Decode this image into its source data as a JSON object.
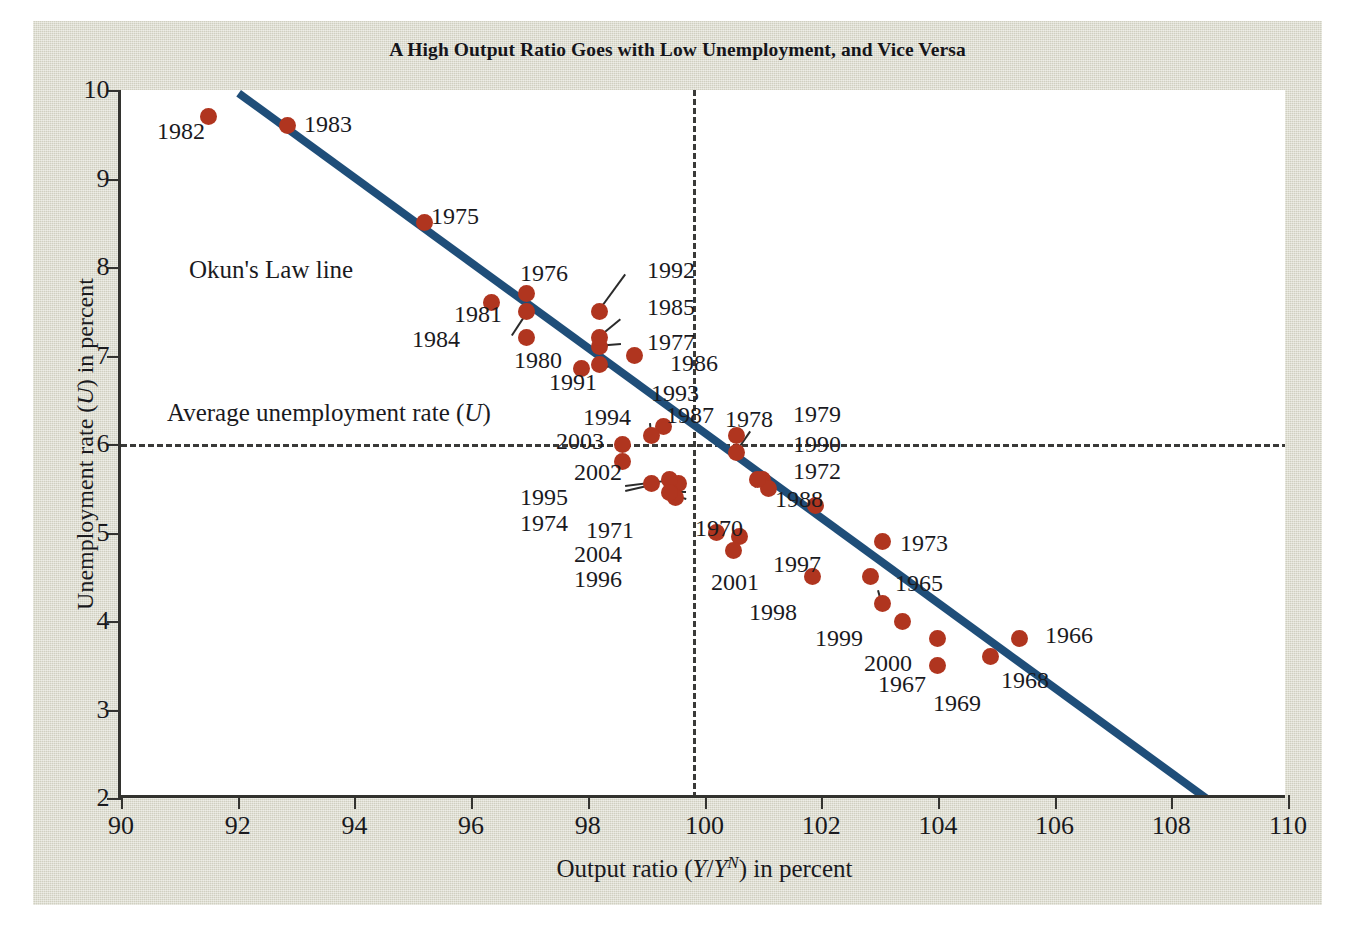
{
  "figure": {
    "title": "A High Output Ratio Goes with Low Unemployment, and Vice Versa",
    "background_color": "#d9d8c9",
    "plot_background_color": "#ffffff",
    "dot_color": "#b0351f",
    "line_color": "#1f4e79",
    "axis_color": "#33332f"
  },
  "annotations": {
    "okun_line_label": "Okun's Law line",
    "average_rate_label_pre": "Average unemployment rate (",
    "average_rate_label_var": "U",
    "average_rate_label_post": ")",
    "average_rate_value": 6.0,
    "vertical_reference_value": 99.8
  },
  "chart_data": {
    "type": "scatter",
    "title": "A High Output Ratio Goes with Low Unemployment, and Vice Versa",
    "xlabel_parts": {
      "pre": "Output ratio (",
      "var1": "Y",
      "sep": "/",
      "var2": "Y",
      "sup": "N",
      "post": ") in percent"
    },
    "xlabel": "Output ratio (Y/Y^N) in percent",
    "ylabel_parts": {
      "pre": "Unemployment rate (",
      "var": "U",
      "post": ") in percent"
    },
    "ylabel": "Unemployment rate (U) in percent",
    "xlim": [
      90,
      110
    ],
    "ylim": [
      2,
      10
    ],
    "xticks": [
      90,
      92,
      94,
      96,
      98,
      100,
      102,
      104,
      106,
      108,
      110
    ],
    "yticks": [
      2,
      3,
      4,
      5,
      6,
      7,
      8,
      9,
      10
    ],
    "grid": false,
    "legend": "none",
    "trend_line": {
      "name": "Okun's Law line",
      "p1": [
        92.05,
        10.0
      ],
      "p2": [
        108.7,
        2.0
      ]
    },
    "reference_lines": [
      {
        "name": "Average unemployment rate (U)",
        "orientation": "horizontal",
        "value": 6.0,
        "style": "dashed"
      },
      {
        "name": "output ratio reference",
        "orientation": "vertical",
        "value": 99.8,
        "style": "dashed"
      }
    ],
    "points": [
      {
        "label": "1965",
        "x": 102.85,
        "y": 4.5
      },
      {
        "label": "1966",
        "x": 105.4,
        "y": 3.8
      },
      {
        "label": "1967",
        "x": 104.0,
        "y": 3.8
      },
      {
        "label": "1968",
        "x": 104.9,
        "y": 3.6
      },
      {
        "label": "1969",
        "x": 104.0,
        "y": 3.5
      },
      {
        "label": "1970",
        "x": 100.2,
        "y": 5.0
      },
      {
        "label": "1971",
        "x": 99.55,
        "y": 5.55
      },
      {
        "label": "1972",
        "x": 101.0,
        "y": 5.6
      },
      {
        "label": "1973",
        "x": 103.05,
        "y": 4.9
      },
      {
        "label": "1974",
        "x": 99.1,
        "y": 5.55
      },
      {
        "label": "1975",
        "x": 95.2,
        "y": 8.5
      },
      {
        "label": "1976",
        "x": 96.95,
        "y": 7.7
      },
      {
        "label": "1977",
        "x": 98.2,
        "y": 7.1
      },
      {
        "label": "1978",
        "x": 100.55,
        "y": 6.1
      },
      {
        "label": "1979",
        "x": 100.55,
        "y": 5.9
      },
      {
        "label": "1980",
        "x": 96.95,
        "y": 7.2
      },
      {
        "label": "1981",
        "x": 96.35,
        "y": 7.6
      },
      {
        "label": "1982",
        "x": 91.5,
        "y": 9.7
      },
      {
        "label": "1983",
        "x": 92.85,
        "y": 9.6
      },
      {
        "label": "1984",
        "x": 96.95,
        "y": 7.5
      },
      {
        "label": "1985",
        "x": 98.2,
        "y": 7.2
      },
      {
        "label": "1986",
        "x": 98.8,
        "y": 7.0
      },
      {
        "label": "1987",
        "x": 99.3,
        "y": 6.2
      },
      {
        "label": "1988",
        "x": 101.1,
        "y": 5.5
      },
      {
        "label": "1989",
        "x": 101.9,
        "y": 5.3
      },
      {
        "label": "1990",
        "x": 100.9,
        "y": 5.6
      },
      {
        "label": "1991",
        "x": 97.9,
        "y": 6.85
      },
      {
        "label": "1992",
        "x": 98.2,
        "y": 7.5
      },
      {
        "label": "1993",
        "x": 98.2,
        "y": 6.9
      },
      {
        "label": "1994",
        "x": 99.1,
        "y": 6.1
      },
      {
        "label": "1995",
        "x": 99.4,
        "y": 5.6
      },
      {
        "label": "1996",
        "x": 99.5,
        "y": 5.4
      },
      {
        "label": "1997",
        "x": 100.6,
        "y": 4.95
      },
      {
        "label": "1998",
        "x": 101.85,
        "y": 4.5
      },
      {
        "label": "1999",
        "x": 103.05,
        "y": 4.2
      },
      {
        "label": "2000",
        "x": 103.4,
        "y": 4.0
      },
      {
        "label": "2001",
        "x": 100.5,
        "y": 4.8
      },
      {
        "label": "2002",
        "x": 98.6,
        "y": 5.8
      },
      {
        "label": "2003",
        "x": 98.6,
        "y": 6.0
      },
      {
        "label": "2004",
        "x": 99.4,
        "y": 5.45
      }
    ]
  }
}
